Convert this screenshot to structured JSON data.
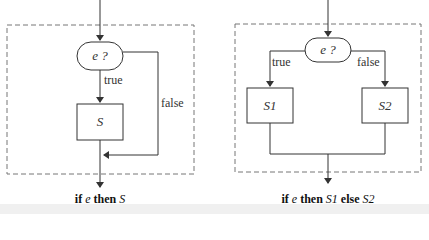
{
  "left": {
    "condition": "e ?",
    "true_label": "true",
    "false_label": "false",
    "statement": "S",
    "caption": {
      "kw_if": "if",
      "e": "e",
      "kw_then": "then",
      "s": "S"
    }
  },
  "right": {
    "condition": "e ?",
    "true_label": "true",
    "false_label": "false",
    "statement_1": "S1",
    "statement_2": "S2",
    "caption": {
      "kw_if": "if",
      "e": "e",
      "kw_then": "then",
      "s1": "S1",
      "kw_else": "else",
      "s2": "S2"
    }
  },
  "colors": {
    "line": "#333333",
    "dash": "#777777"
  }
}
